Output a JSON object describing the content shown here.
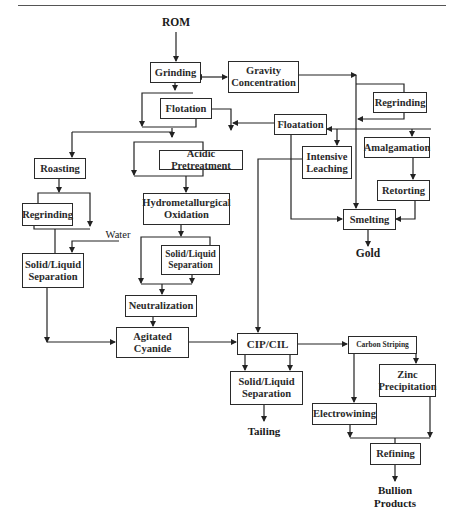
{
  "diagram": {
    "type": "flowchart",
    "terminals": {
      "input": "ROM",
      "gold": "Gold",
      "water": "Water",
      "tailing": "Tailing",
      "bullion": [
        "Bullion",
        "Products"
      ]
    },
    "nodes": {
      "grinding": "Grinding",
      "gravity_concentration": [
        "Gravity",
        "Concentration"
      ],
      "regrinding_right": "Regrinding",
      "flotation": "Flotation",
      "floatation": "Floatation",
      "amalgamation": "Amalgamation",
      "intensive_leaching": [
        "Intensive",
        "Leaching"
      ],
      "roasting": "Roasting",
      "acidic_pretreatment": "Acidic Pretreatment",
      "retorting": "Retorting",
      "regrinding_left": "Regrinding",
      "hydrometallurgical_oxidation": [
        "Hydrometallurgical",
        "Oxidation"
      ],
      "smelting": "Smelting",
      "solid_liquid_left": [
        "Solid/Liquid",
        "Separation"
      ],
      "solid_liquid_mid": [
        "Solid/Liquid",
        "Separation"
      ],
      "neutralization": "Neutralization",
      "agitated_cyanide": [
        "Agitated",
        "Cyanide"
      ],
      "cip_cil": "CIP/CIL",
      "carbon_striping": "Carbon Striping",
      "solid_liquid_bottom": [
        "Solid/Liquid",
        "Separation"
      ],
      "zinc_precipitation": [
        "Zinc",
        "Precipitation"
      ],
      "electrowining": "Electrowining",
      "refining": "Refining"
    },
    "edges": [
      [
        "ROM",
        "Grinding"
      ],
      [
        "Grinding",
        "Gravity Concentration",
        "bidirectional"
      ],
      [
        "Grinding",
        "Flotation"
      ],
      [
        "Gravity Concentration",
        "Regrinding (right)"
      ],
      [
        "Regrinding (right)",
        "Smelting"
      ],
      [
        "Floatation",
        "Flotation branch"
      ],
      [
        "Floatation",
        "Intensive Leaching"
      ],
      [
        "Floatation",
        "Amalgamation"
      ],
      [
        "Floatation",
        "Smelting"
      ],
      [
        "Amalgamation",
        "Retorting"
      ],
      [
        "Retorting",
        "Smelting"
      ],
      [
        "Smelting",
        "Gold"
      ],
      [
        "Flotation",
        "Roasting"
      ],
      [
        "Flotation",
        "Acidic Pretreatment"
      ],
      [
        "Roasting",
        "Regrinding (left)"
      ],
      [
        "Regrinding (left)",
        "Solid/Liquid Separation (left)"
      ],
      [
        "Water",
        "Solid/Liquid Separation (left)"
      ],
      [
        "Acidic Pretreatment",
        "Hydrometallurgical Oxidation"
      ],
      [
        "Hydrometallurgical Oxidation",
        "Solid/Liquid Separation (mid)"
      ],
      [
        "Solid/Liquid Separation (mid)",
        "Neutralization"
      ],
      [
        "Neutralization",
        "Agitated Cyanide"
      ],
      [
        "Solid/Liquid Separation (left)",
        "Agitated Cyanide"
      ],
      [
        "Agitated Cyanide",
        "CIP/CIL"
      ],
      [
        "Intensive Leaching",
        "CIP/CIL"
      ],
      [
        "CIP/CIL",
        "Solid/Liquid Separation (bottom)"
      ],
      [
        "CIP/CIL",
        "Carbon Striping"
      ],
      [
        "Solid/Liquid Separation (bottom)",
        "Tailing"
      ],
      [
        "Carbon Striping",
        "Electrowining"
      ],
      [
        "Carbon Striping",
        "Zinc Precipitation"
      ],
      [
        "Electrowining",
        "Refining"
      ],
      [
        "Zinc Precipitation",
        "Refining"
      ],
      [
        "Refining",
        "Bullion Products"
      ]
    ]
  }
}
